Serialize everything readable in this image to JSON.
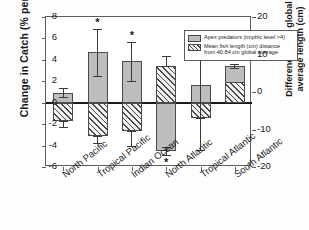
{
  "chart_data": {
    "type": "bar",
    "title": "",
    "subtitle": "",
    "xlabel": "",
    "ylabel": "Change in Catch (% per year)",
    "ylabel_right": "Difference from global average length (cm)",
    "categories": [
      "North Pacific",
      "Tropical Pacific",
      "Indian Ocean",
      "North Atlantic",
      "Tropical Atlantic",
      "South Atlantic"
    ],
    "ylim": [
      -6,
      8
    ],
    "yticks": [
      8,
      6,
      4,
      2,
      0,
      -2,
      -4,
      -6
    ],
    "ylim_right": [
      -20,
      20
    ],
    "yticks_right": [
      20,
      10,
      0,
      -10,
      -20
    ],
    "grid": false,
    "legend_position": "top-right",
    "zero_line": 0,
    "series": [
      {
        "name": "Apex predators (trophic level >4)",
        "axis": "left",
        "units": "% per year",
        "fill": "solid-gray",
        "values": [
          0.9,
          4.7,
          3.9,
          -4.5,
          1.7,
          3.4
        ],
        "err_low": [
          0.4,
          2.2,
          1.9,
          0.4,
          3.1,
          0.2
        ],
        "err_high": [
          0.5,
          2.2,
          1.8,
          0.4,
          2.5,
          0.2
        ],
        "significant": [
          false,
          true,
          true,
          true,
          false,
          true
        ]
      },
      {
        "name": "Mean fish length (cm) distance from 40.84 cm global average",
        "axis": "right",
        "units": "cm",
        "fill": "hatched",
        "values_left_scale": [
          -1.7,
          -3.1,
          -2.6,
          3.4,
          -1.4,
          1.9
        ],
        "values_cm": [
          -5.7,
          -10.3,
          -8.7,
          11.3,
          -4.7,
          6.3
        ],
        "err_low_left": [
          0.6,
          0.7,
          1.4,
          0.0,
          3.0,
          0.0
        ],
        "err_high_left": [
          0.0,
          0.0,
          0.0,
          1.0,
          5.6,
          0.0
        ],
        "significant": [
          false,
          false,
          false,
          false,
          false,
          false
        ]
      }
    ],
    "annotations": [
      {
        "label": "*",
        "category": "Tropical Pacific",
        "meaning": "significant"
      },
      {
        "label": "*",
        "category": "Indian Ocean",
        "meaning": "significant"
      },
      {
        "label": "*",
        "category": "North Atlantic",
        "meaning": "significant"
      },
      {
        "label": "*",
        "category": "South Atlantic",
        "meaning": "significant"
      }
    ]
  },
  "legend": {
    "items": [
      {
        "swatch": "solid",
        "line1": "Apex predators (trophic level >4)",
        "line2": ""
      },
      {
        "swatch": "hatch",
        "line1": "Mean fish length (cm) distance",
        "line2": "from 40.84 cm global average"
      }
    ]
  },
  "axis": {
    "left_title": "Change in Catch (% per year)",
    "right_title_line1": "Difference from global",
    "right_title_line2": "average length (cm)",
    "left_ticks": [
      "8",
      "6",
      "4",
      "2",
      "0",
      "-2",
      "-4",
      "-6"
    ],
    "right_ticks": [
      "20",
      "10",
      "0",
      "-10",
      "-20"
    ]
  },
  "categories": [
    "North Pacific",
    "Tropical Pacific",
    "Indian Ocean",
    "North Atlantic",
    "Tropical Atlantic",
    "South Atlantic"
  ]
}
